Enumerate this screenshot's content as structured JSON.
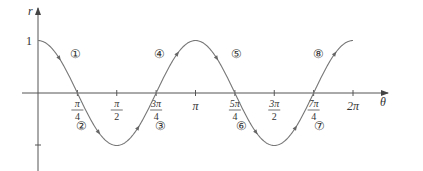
{
  "chart_data": {
    "type": "line",
    "title": "",
    "function": "r = cos 2θ",
    "xlabel": "θ",
    "ylabel": "r",
    "xlim": [
      0,
      6.2832
    ],
    "ylim": [
      -1,
      1
    ],
    "grid": false,
    "x_ticks": [
      "π/4",
      "π/2",
      "3π/4",
      "π",
      "5π/4",
      "3π/2",
      "7π/4",
      "2π"
    ],
    "y_ticks": [
      "1",
      "-1"
    ],
    "y_tick_labels_shown": [
      "1"
    ],
    "x": [
      0,
      0.7854,
      1.5708,
      2.3562,
      3.1416,
      3.927,
      4.7124,
      5.4978,
      6.2832
    ],
    "values": [
      1,
      0,
      -1,
      0,
      1,
      0,
      -1,
      0,
      1
    ],
    "annotations": [
      {
        "label": "①",
        "segment": "0 to π/4",
        "position": "above"
      },
      {
        "label": "②",
        "segment": "π/4 to π/2",
        "position": "below"
      },
      {
        "label": "③",
        "segment": "π/2 to 3π/4",
        "position": "below"
      },
      {
        "label": "④",
        "segment": "3π/4 to π",
        "position": "above"
      },
      {
        "label": "⑤",
        "segment": "π to 5π/4",
        "position": "above"
      },
      {
        "label": "⑥",
        "segment": "5π/4 to 3π/2",
        "position": "below"
      },
      {
        "label": "⑦",
        "segment": "3π/2 to 7π/4",
        "position": "below"
      },
      {
        "label": "⑧",
        "segment": "7π/4 to 2π",
        "position": "above"
      }
    ]
  },
  "axes": {
    "x_label": "θ",
    "y_label": "r",
    "y_one": "1"
  },
  "ticks": [
    {
      "num": "π",
      "den": "4"
    },
    {
      "num": "π",
      "den": "2"
    },
    {
      "num": "3π",
      "den": "4"
    },
    {
      "num": "π",
      "den": ""
    },
    {
      "num": "5π",
      "den": "4"
    },
    {
      "num": "3π",
      "den": "2"
    },
    {
      "num": "7π",
      "den": "4"
    },
    {
      "num": "2π",
      "den": ""
    }
  ],
  "labels": [
    "①",
    "②",
    "③",
    "④",
    "⑤",
    "⑥",
    "⑦",
    "⑧"
  ],
  "colors": {
    "curve": "#777777",
    "axis": "#555555",
    "text": "#333333"
  }
}
